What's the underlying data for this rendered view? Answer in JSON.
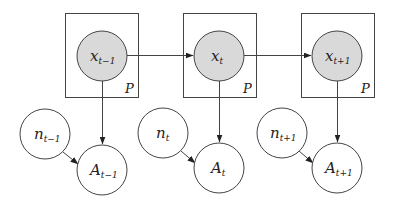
{
  "diagram": {
    "type": "dynamic graphical model (plate notation)",
    "plate_label": "P",
    "slices": [
      {
        "latent": {
          "base": "x",
          "sub": "t−1"
        },
        "noise": {
          "base": "n",
          "sub": "t−1"
        },
        "observed": {
          "base": "A",
          "sub": "t−1"
        }
      },
      {
        "latent": {
          "base": "x",
          "sub": "t"
        },
        "noise": {
          "base": "n",
          "sub": "t"
        },
        "observed": {
          "base": "A",
          "sub": "t"
        }
      },
      {
        "latent": {
          "base": "x",
          "sub": "t+1"
        },
        "noise": {
          "base": "n",
          "sub": "t+1"
        },
        "observed": {
          "base": "A",
          "sub": "t+1"
        }
      }
    ],
    "edges": [
      [
        "x_{t-1}",
        "x_t"
      ],
      [
        "x_t",
        "x_{t+1}"
      ],
      [
        "x_{t-1}",
        "A_{t-1}"
      ],
      [
        "n_{t-1}",
        "A_{t-1}"
      ],
      [
        "x_t",
        "A_t"
      ],
      [
        "n_t",
        "A_t"
      ],
      [
        "x_{t+1}",
        "A_{t+1}"
      ],
      [
        "n_{t+1}",
        "A_{t+1}"
      ]
    ],
    "colors": {
      "latent_fill": "#d9d9d9",
      "observed_fill": "#ffffff",
      "stroke": "#444444"
    }
  }
}
